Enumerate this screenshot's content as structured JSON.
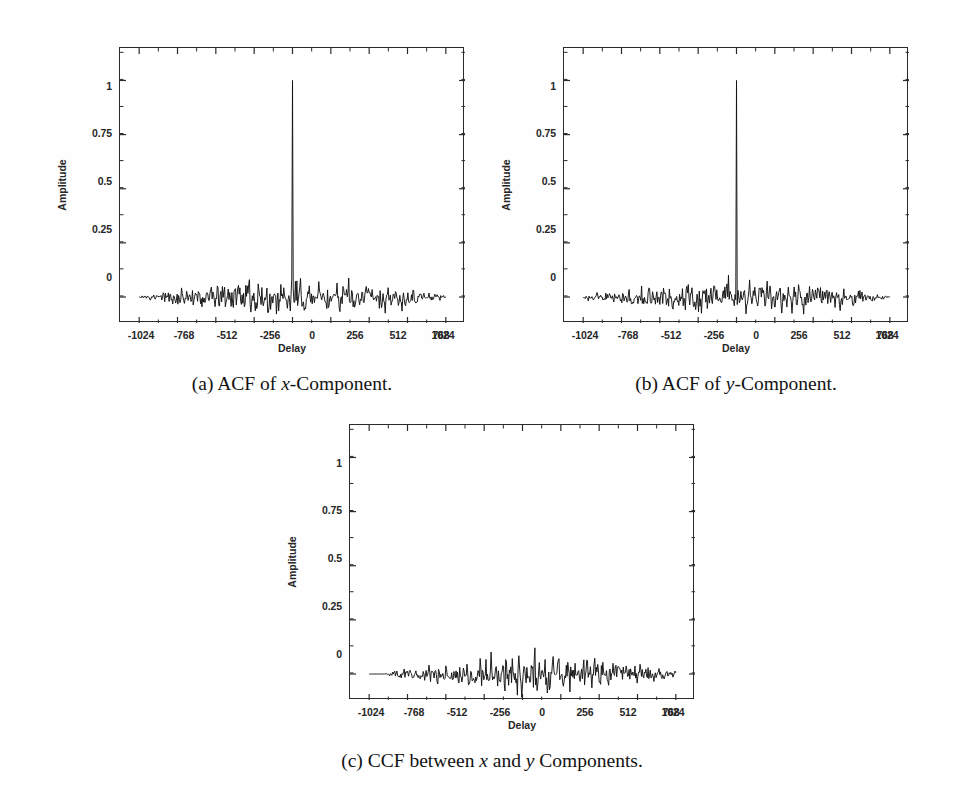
{
  "figure": {
    "background_color": "#fefefe",
    "ink_color": "#2b2b2b",
    "axis_title_y": "Amplitude",
    "axis_title_x": "Delay"
  },
  "subfigures": [
    {
      "id": "a",
      "caption_prefix": "(a)",
      "caption_pre": "ACF of ",
      "caption_var": "x",
      "caption_post": "-Component.",
      "caption_plain": "(a) ACF of x-Component."
    },
    {
      "id": "b",
      "caption_prefix": "(b)",
      "caption_pre": "ACF of ",
      "caption_var": "y",
      "caption_post": "-Component.",
      "caption_plain": "(b) ACF of y-Component."
    },
    {
      "id": "c",
      "caption_prefix": "(c)",
      "caption_pre": "CCF between ",
      "caption_var": "x",
      "caption_mid": " and ",
      "caption_var2": "y",
      "caption_post": " Components.",
      "caption_plain": "(c) CCF between x and y Components."
    }
  ],
  "chart_data": [
    {
      "type": "line",
      "id": "acf-x",
      "title": "(a) ACF of x-Component.",
      "xlabel": "Delay",
      "ylabel": "Amplitude",
      "xlim": [
        -1152,
        1152
      ],
      "ylim": [
        -0.12,
        1.15
      ],
      "xticks": [
        -1024,
        -768,
        -512,
        -256,
        0,
        256,
        512,
        768,
        1024
      ],
      "xticklabels": [
        "-1024",
        "-768",
        "-512",
        "-256",
        "0",
        "256",
        "512",
        "768",
        "1024"
      ],
      "yticks": [
        0,
        0.25,
        0.5,
        0.75,
        1
      ],
      "yticklabels": [
        "0",
        "0.25",
        "0.5",
        "0.75",
        "1"
      ],
      "grid": false,
      "legend": null,
      "series": [
        {
          "name": "autocorrelation of x",
          "description": "Unit peak of amplitude 1.0 at delay 0; elsewhere zero-mean noise floor with triangular envelope, sidelobes roughly within -0.07..+0.10 near the centre and decaying to near 0 at +/-1024.",
          "peak_delay": 0,
          "peak_amplitude": 1.0,
          "noise_rms": 0.025,
          "noise_envelope_max": 0.1,
          "noise_envelope_min": -0.08,
          "data_span": [
            -1024,
            1024
          ],
          "samples": 420,
          "seed": 11
        }
      ]
    },
    {
      "type": "line",
      "id": "acf-y",
      "title": "(b) ACF of y-Component.",
      "xlabel": "Delay",
      "ylabel": "Amplitude",
      "xlim": [
        -1152,
        1152
      ],
      "ylim": [
        -0.12,
        1.15
      ],
      "xticks": [
        -1024,
        -768,
        -512,
        -256,
        0,
        256,
        512,
        768,
        1024
      ],
      "xticklabels": [
        "-1024",
        "-768",
        "-512",
        "-256",
        "0",
        "256",
        "512",
        "768",
        "1024"
      ],
      "yticks": [
        0,
        0.25,
        0.5,
        0.75,
        1
      ],
      "yticklabels": [
        "0",
        "0.25",
        "0.5",
        "0.75",
        "1"
      ],
      "grid": false,
      "legend": null,
      "series": [
        {
          "name": "autocorrelation of y",
          "description": "Unit peak of amplitude 1.0 at delay 0; elsewhere zero-mean noise floor with triangular envelope, sidelobes roughly within -0.07..+0.09.",
          "peak_delay": 0,
          "peak_amplitude": 1.0,
          "noise_rms": 0.024,
          "noise_envelope_max": 0.095,
          "noise_envelope_min": -0.075,
          "data_span": [
            -1024,
            1024
          ],
          "samples": 420,
          "seed": 27
        }
      ]
    },
    {
      "type": "line",
      "id": "ccf-xy",
      "title": "(c) CCF between x and y Components.",
      "xlabel": "Delay",
      "ylabel": "Amplitude",
      "xlim": [
        -1152,
        1152
      ],
      "ylim": [
        -0.12,
        1.15
      ],
      "xticks": [
        -1024,
        -768,
        -512,
        -256,
        0,
        256,
        512,
        768,
        1024
      ],
      "xticklabels": [
        "-1024",
        "-768",
        "-512",
        "-256",
        "0",
        "256",
        "512",
        "768",
        "1024"
      ],
      "yticks": [
        0,
        0.25,
        0.5,
        0.75,
        1
      ],
      "yticklabels": [
        "0",
        "0.25",
        "0.5",
        "0.75",
        "1"
      ],
      "grid": false,
      "legend": null,
      "series": [
        {
          "name": "cross-correlation of x and y",
          "description": "No central peak. Zero-mean noise only, triangular envelope peaking near delay 0..256, values roughly within -0.09..+0.11, tapering to near 0 at +/-1024.",
          "peak_delay": null,
          "peak_amplitude": null,
          "noise_rms": 0.028,
          "noise_envelope_max": 0.11,
          "noise_envelope_min": -0.095,
          "data_span": [
            -1024,
            1024
          ],
          "samples": 420,
          "seed": 53
        }
      ]
    }
  ]
}
